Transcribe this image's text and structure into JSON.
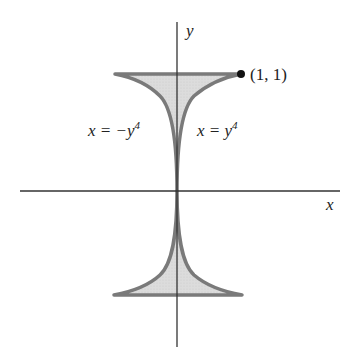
{
  "figure": {
    "axes": {
      "x_label": "x",
      "y_label": "y"
    },
    "curves": {
      "left_label_prefix": "x = −y",
      "left_label_exp": "4",
      "right_label_prefix": "x = y",
      "right_label_exp": "4"
    },
    "point": {
      "label": "(1, 1)",
      "x": 1,
      "y": 1
    },
    "region": {
      "fill_color": "#d9d9d9",
      "stroke_color": "#7a7a7a",
      "description": "Region bounded by x = y^4, x = -y^4, y = 1 and y = -1"
    }
  }
}
